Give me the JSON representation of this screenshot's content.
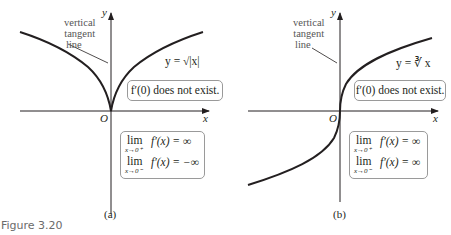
{
  "figure": {
    "caption": "Figure 3.20",
    "panels": [
      {
        "id": "a",
        "label": "(a)",
        "axis_x": "x",
        "axis_y": "y",
        "origin": "O",
        "annotation": [
          "vertical",
          "tangent",
          "line"
        ],
        "equation": "y = √|x|",
        "derivative_note": "f′(0) does not exist.",
        "limits": [
          {
            "lim": "lim",
            "sub": "x→0⁺",
            "expr": "f′(x) = ∞"
          },
          {
            "lim": "lim",
            "sub": "x→0⁻",
            "expr": "f′(x) = −∞"
          }
        ]
      },
      {
        "id": "b",
        "label": "(b)",
        "axis_x": "x",
        "axis_y": "y",
        "origin": "O",
        "annotation": [
          "vertical",
          "tangent",
          "line"
        ],
        "equation": "y = ∛ x",
        "derivative_note": "f′(0) does not exist.",
        "limits": [
          {
            "lim": "lim",
            "sub": "x→0⁺",
            "expr": "f′(x) = ∞"
          },
          {
            "lim": "lim",
            "sub": "x→0⁻",
            "expr": "f′(x) = ∞"
          }
        ]
      }
    ]
  },
  "colors": {
    "curve": "#231f20",
    "axis": "#231f20",
    "box_border": "#9a9a9a",
    "caption": "#6b6b6b"
  }
}
